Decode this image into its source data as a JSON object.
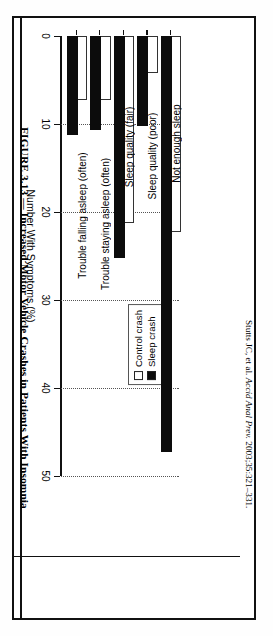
{
  "figure": {
    "title": "FIGURE 3.13 — Increased Motor Vehicle Crashes in Patients With Insomnia",
    "citation_author": "Stutts JC, et al. ",
    "citation_journal": "Accid Anal Prev.",
    "citation_rest": " 2003;35:321–331."
  },
  "legend": {
    "items": [
      {
        "label": "Control crash",
        "style": "open",
        "color": "#ffffff"
      },
      {
        "label": "Sleep crash",
        "style": "filled",
        "color": "#0c0c0c"
      }
    ]
  },
  "chart_data": {
    "type": "bar",
    "title": "Increased Motor Vehicle Crashes in Patients With Insomnia",
    "orientation": "vertical",
    "categories": [
      "Not enough sleep",
      "Sleep quality (poor)",
      "Sleep quality (fair)",
      "Trouble staying asleep (often)",
      "Trouble falling asleep (often)"
    ],
    "series": [
      {
        "name": "Control crash",
        "values": [
          22,
          4,
          21,
          7,
          7
        ]
      },
      {
        "name": "Sleep crash",
        "values": [
          47,
          10,
          25,
          10.5,
          11
        ]
      }
    ],
    "xlabel": "",
    "ylabel": "Number With Symptoms (%)",
    "ylim": [
      0,
      50
    ],
    "yticks": [
      0,
      10,
      20,
      30,
      40,
      50
    ],
    "ytick_labels": [
      "0",
      "10",
      "20",
      "30",
      "40",
      "50"
    ],
    "grid": true,
    "grid_style": "dotted",
    "legend_position": "upper right"
  }
}
